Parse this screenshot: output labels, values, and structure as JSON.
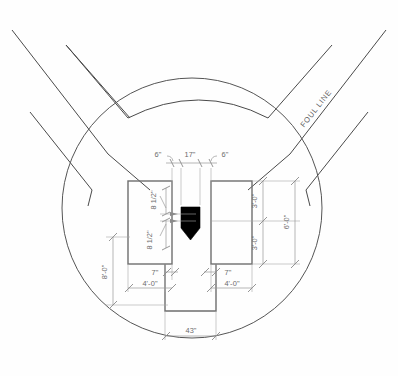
{
  "drawing": {
    "title": "Baseball Home Plate Area Layout",
    "background_color": "#fefefe",
    "line_color": "#4a4a4a",
    "dimension_color": "#6b6b6b",
    "plate_color": "#000000"
  },
  "labels": {
    "foul_line": "FOUL LINE"
  },
  "dimensions": {
    "top_left_offset": "6\"",
    "plate_width": "17\"",
    "top_right_offset": "6\"",
    "left_box_upper": "8 1/2\"",
    "left_box_lower": "8 1/2\"",
    "right_box_upper": "3'-0\"",
    "right_box_lower": "3'-0\"",
    "right_box_total": "6'-0\"",
    "left_box_total": "8'-0\"",
    "left_catcher_offset": "7\"",
    "left_catcher_width": "4'-0\"",
    "right_catcher_offset": "7\"",
    "right_catcher_width": "4'-0\"",
    "catcher_box_width": "43\""
  },
  "geometry": {
    "circle_center_x": 192,
    "circle_center_y": 208,
    "circle_radius": 146,
    "left_box": {
      "x": 128,
      "y": 181,
      "w": 44,
      "h": 83
    },
    "right_box": {
      "x": 211,
      "y": 181,
      "w": 41,
      "h": 83
    },
    "catcher_box": {
      "x": 165,
      "y": 264,
      "w": 51,
      "h": 47
    }
  }
}
